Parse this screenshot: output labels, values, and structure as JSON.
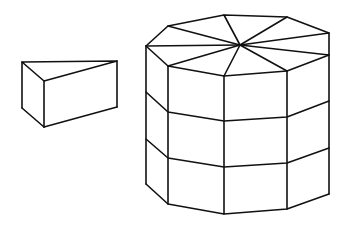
{
  "diagram": {
    "description": "Line drawing of a triangular prism (a single wedge slice) beside an octagonal prism stacked in three layers whose top face is divided into eight triangular wedges",
    "colors": {
      "stroke": "#111111",
      "background": "#ffffff"
    },
    "shapes": [
      {
        "id": "triangular-prism",
        "top": [
          [
            22,
            62
          ],
          [
            117,
            61
          ],
          [
            44,
            81
          ]
        ],
        "bottom": [
          [
            22,
            108
          ],
          [
            117,
            107
          ],
          [
            44,
            127
          ]
        ]
      },
      {
        "id": "octagonal-prism",
        "top_vertices": [
          [
            146,
            46
          ],
          [
            168,
            26
          ],
          [
            224,
            15
          ],
          [
            287,
            17
          ],
          [
            329,
            33
          ],
          [
            329,
            55
          ],
          [
            287,
            71
          ],
          [
            224,
            76
          ],
          [
            168,
            66
          ]
        ],
        "top_center": [
          240,
          45
        ],
        "layer_lines": [
          [
            [
              146,
              92
            ],
            [
              168,
              112
            ],
            [
              224,
              121
            ],
            [
              287,
              117
            ],
            [
              329,
              101
            ]
          ],
          [
            [
              146,
              139
            ],
            [
              168,
              158
            ],
            [
              224,
              167
            ],
            [
              287,
              163
            ],
            [
              329,
              148
            ]
          ],
          [
            [
              146,
              184
            ],
            [
              168,
              204
            ],
            [
              224,
              214
            ],
            [
              287,
              209
            ],
            [
              329,
              194
            ]
          ]
        ],
        "layers": 3,
        "wedges": 8
      }
    ]
  }
}
